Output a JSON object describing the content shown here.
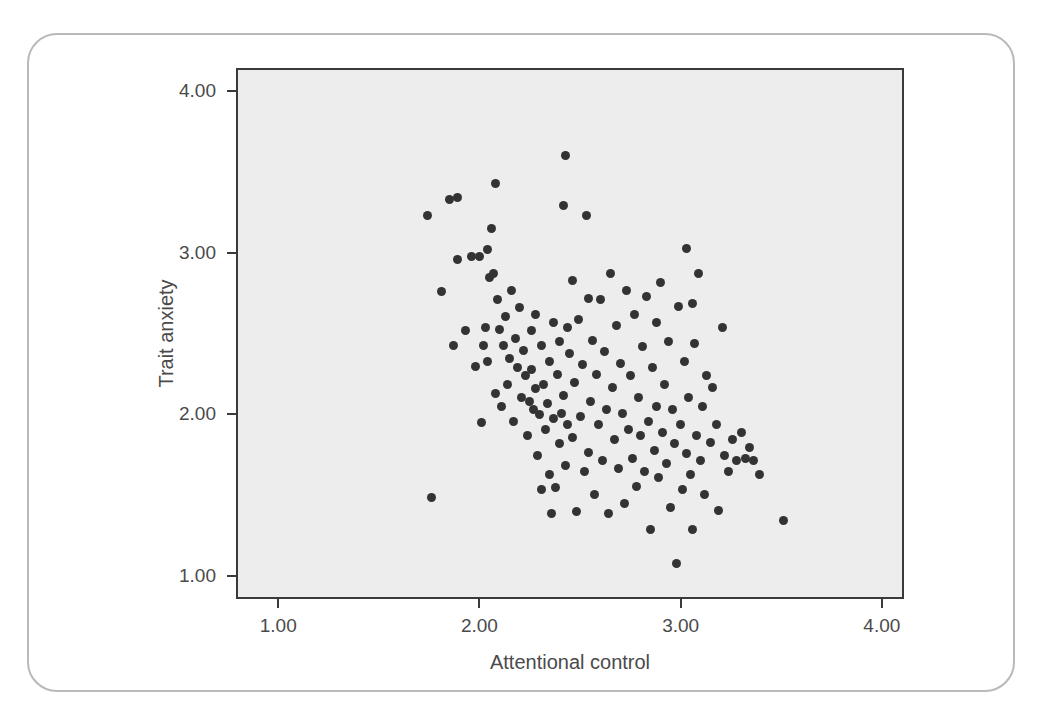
{
  "chart_data": {
    "type": "scatter",
    "title": "",
    "xlabel": "Attentional control",
    "ylabel": "Trait anxiety",
    "xlim": [
      0.79,
      4.11
    ],
    "ylim": [
      0.86,
      4.14
    ],
    "xticks": [
      "1.00",
      "2.00",
      "3.00",
      "4.00"
    ],
    "xtickvalues": [
      1.0,
      2.0,
      3.0,
      4.0
    ],
    "yticks": [
      "4.00",
      "3.00",
      "2.00",
      "1.00"
    ],
    "ytickvalues": [
      4.0,
      3.0,
      2.0,
      1.0
    ],
    "grid": false,
    "legend": null,
    "marker": "filled-circle",
    "marker_color": "#333333",
    "plot_background": "#ededed",
    "n_points": 158,
    "relationship": "negative",
    "points": [
      [
        1.73,
        3.24
      ],
      [
        1.75,
        1.5
      ],
      [
        1.8,
        2.77
      ],
      [
        1.84,
        3.34
      ],
      [
        1.86,
        2.44
      ],
      [
        1.88,
        3.35
      ],
      [
        1.88,
        2.97
      ],
      [
        1.92,
        2.53
      ],
      [
        1.95,
        2.99
      ],
      [
        1.97,
        2.31
      ],
      [
        1.99,
        2.99
      ],
      [
        2.0,
        1.96
      ],
      [
        2.01,
        2.44
      ],
      [
        2.02,
        2.55
      ],
      [
        2.03,
        3.03
      ],
      [
        2.03,
        2.34
      ],
      [
        2.04,
        2.86
      ],
      [
        2.05,
        3.16
      ],
      [
        2.06,
        2.88
      ],
      [
        2.07,
        2.14
      ],
      [
        2.07,
        3.44
      ],
      [
        2.08,
        2.72
      ],
      [
        2.09,
        2.54
      ],
      [
        2.1,
        2.06
      ],
      [
        2.11,
        2.44
      ],
      [
        2.12,
        2.62
      ],
      [
        2.13,
        2.2
      ],
      [
        2.14,
        2.36
      ],
      [
        2.15,
        2.78
      ],
      [
        2.16,
        1.97
      ],
      [
        2.17,
        2.48
      ],
      [
        2.18,
        2.3
      ],
      [
        2.19,
        2.67
      ],
      [
        2.2,
        2.12
      ],
      [
        2.21,
        2.41
      ],
      [
        2.22,
        2.25
      ],
      [
        2.23,
        1.88
      ],
      [
        2.24,
        2.09
      ],
      [
        2.25,
        2.53
      ],
      [
        2.25,
        2.29
      ],
      [
        2.26,
        2.04
      ],
      [
        2.27,
        2.63
      ],
      [
        2.27,
        2.17
      ],
      [
        2.28,
        1.76
      ],
      [
        2.29,
        2.01
      ],
      [
        2.3,
        2.44
      ],
      [
        2.3,
        1.55
      ],
      [
        2.31,
        2.2
      ],
      [
        2.32,
        1.92
      ],
      [
        2.33,
        2.08
      ],
      [
        2.34,
        1.64
      ],
      [
        2.34,
        2.34
      ],
      [
        2.35,
        1.4
      ],
      [
        2.36,
        2.58
      ],
      [
        2.36,
        1.99
      ],
      [
        2.37,
        1.56
      ],
      [
        2.38,
        2.26
      ],
      [
        2.39,
        2.46
      ],
      [
        2.39,
        1.83
      ],
      [
        2.4,
        2.02
      ],
      [
        2.41,
        3.3
      ],
      [
        2.41,
        2.13
      ],
      [
        2.42,
        3.61
      ],
      [
        2.42,
        1.7
      ],
      [
        2.43,
        2.55
      ],
      [
        2.43,
        1.95
      ],
      [
        2.44,
        2.39
      ],
      [
        2.45,
        2.84
      ],
      [
        2.45,
        1.87
      ],
      [
        2.46,
        2.21
      ],
      [
        2.47,
        1.41
      ],
      [
        2.48,
        2.6
      ],
      [
        2.49,
        2.0
      ],
      [
        2.5,
        2.32
      ],
      [
        2.51,
        1.66
      ],
      [
        2.52,
        3.24
      ],
      [
        2.53,
        2.73
      ],
      [
        2.53,
        1.78
      ],
      [
        2.54,
        2.09
      ],
      [
        2.55,
        2.47
      ],
      [
        2.56,
        1.52
      ],
      [
        2.57,
        2.26
      ],
      [
        2.58,
        1.95
      ],
      [
        2.59,
        2.72
      ],
      [
        2.6,
        1.73
      ],
      [
        2.61,
        2.4
      ],
      [
        2.62,
        2.04
      ],
      [
        2.63,
        1.4
      ],
      [
        2.64,
        2.88
      ],
      [
        2.65,
        2.18
      ],
      [
        2.66,
        1.86
      ],
      [
        2.67,
        2.56
      ],
      [
        2.68,
        1.68
      ],
      [
        2.69,
        2.33
      ],
      [
        2.7,
        2.02
      ],
      [
        2.71,
        1.46
      ],
      [
        2.72,
        2.78
      ],
      [
        2.73,
        1.92
      ],
      [
        2.74,
        2.25
      ],
      [
        2.75,
        1.74
      ],
      [
        2.76,
        2.63
      ],
      [
        2.77,
        1.57
      ],
      [
        2.78,
        2.12
      ],
      [
        2.79,
        1.88
      ],
      [
        2.8,
        2.43
      ],
      [
        2.81,
        1.66
      ],
      [
        2.82,
        2.74
      ],
      [
        2.83,
        1.97
      ],
      [
        2.84,
        1.3
      ],
      [
        2.85,
        2.3
      ],
      [
        2.86,
        1.79
      ],
      [
        2.87,
        2.58
      ],
      [
        2.87,
        2.06
      ],
      [
        2.88,
        1.62
      ],
      [
        2.89,
        2.83
      ],
      [
        2.9,
        1.9
      ],
      [
        2.91,
        2.2
      ],
      [
        2.92,
        1.71
      ],
      [
        2.93,
        2.46
      ],
      [
        2.94,
        1.44
      ],
      [
        2.95,
        2.04
      ],
      [
        2.96,
        1.83
      ],
      [
        2.97,
        1.09
      ],
      [
        2.98,
        2.68
      ],
      [
        2.99,
        1.95
      ],
      [
        3.0,
        1.55
      ],
      [
        3.01,
        2.34
      ],
      [
        3.02,
        3.04
      ],
      [
        3.02,
        1.77
      ],
      [
        3.03,
        2.12
      ],
      [
        3.04,
        1.64
      ],
      [
        3.05,
        2.7
      ],
      [
        3.05,
        1.3
      ],
      [
        3.06,
        2.45
      ],
      [
        3.07,
        1.88
      ],
      [
        3.08,
        2.88
      ],
      [
        3.09,
        1.73
      ],
      [
        3.1,
        2.06
      ],
      [
        3.11,
        1.52
      ],
      [
        3.12,
        2.25
      ],
      [
        3.14,
        1.84
      ],
      [
        3.15,
        2.18
      ],
      [
        3.17,
        1.95
      ],
      [
        3.18,
        1.42
      ],
      [
        3.2,
        2.55
      ],
      [
        3.21,
        1.76
      ],
      [
        3.23,
        1.66
      ],
      [
        3.25,
        1.86
      ],
      [
        3.27,
        1.73
      ],
      [
        3.29,
        1.9
      ],
      [
        3.31,
        1.74
      ],
      [
        3.33,
        1.81
      ],
      [
        3.35,
        1.73
      ],
      [
        3.38,
        1.64
      ],
      [
        3.5,
        1.36
      ]
    ]
  },
  "card": {
    "border_color": "#b9b9b9"
  }
}
